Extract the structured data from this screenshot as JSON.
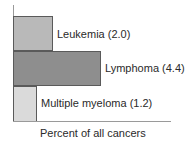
{
  "chart_data": {
    "type": "bar",
    "orientation": "horizontal",
    "title": "",
    "xlabel": "Percent of all cancers",
    "ylabel": "",
    "categories": [
      "Leukemia",
      "Lymphoma",
      "Multiple myeloma"
    ],
    "values": [
      2.0,
      4.4,
      1.2
    ],
    "labels": [
      "Leukemia (2.0)",
      "Lymphoma (4.4)",
      "Multiple myeloma (1.2)"
    ],
    "colors": [
      "#b9b9b9",
      "#8e8e8e",
      "#dadada"
    ],
    "xlim": [
      0,
      7.9
    ],
    "grid": false,
    "legend": "none"
  }
}
